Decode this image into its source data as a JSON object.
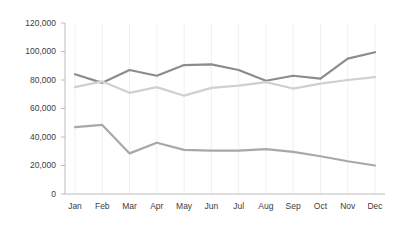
{
  "chart_data": {
    "type": "line",
    "title": "",
    "xlabel": "",
    "ylabel": "",
    "categories": [
      "Jan",
      "Feb",
      "Mar",
      "Apr",
      "May",
      "Jun",
      "Jul",
      "Aug",
      "Sep",
      "Oct",
      "Nov",
      "Dec"
    ],
    "ylim": [
      0,
      120000
    ],
    "yticks": [
      0,
      20000,
      40000,
      60000,
      80000,
      100000,
      120000
    ],
    "ytick_labels": [
      "0",
      "20,000",
      "40,000",
      "60,000",
      "80,000",
      "100,000",
      "120,000"
    ],
    "grid": "vertical",
    "legend": "none",
    "series": [
      {
        "name": "series-dark",
        "color": "#8c8c8c",
        "values": [
          84000,
          78000,
          87000,
          83000,
          90500,
          91000,
          87000,
          79500,
          83000,
          81000,
          95000,
          99500
        ]
      },
      {
        "name": "series-light",
        "color": "#d0d0d0",
        "values": [
          75000,
          79000,
          71000,
          75000,
          69000,
          74500,
          76000,
          78500,
          74000,
          77500,
          80000,
          82000
        ]
      },
      {
        "name": "series-mid",
        "color": "#a8a8a8",
        "values": [
          47000,
          48500,
          28500,
          36000,
          31000,
          30500,
          30500,
          31500,
          29500,
          26500,
          23000,
          20000
        ]
      }
    ]
  },
  "axes": {
    "axis_color": "#bcbcbc",
    "grid_color": "#f0f0f0",
    "tick_text_color": "#3d3d3d"
  }
}
